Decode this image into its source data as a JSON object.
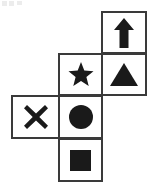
{
  "figure": {
    "name": "cube-net-symbols",
    "type": "cube-net",
    "grid": {
      "columns": 3,
      "rows": 4,
      "cell_width": 46,
      "cell_height": 43,
      "origin_x": 11,
      "origin_y": 11
    },
    "stroke_color": "#3a3a3a",
    "fill_color": "#1a1a1a",
    "background_color": "#ffffff",
    "cells": [
      {
        "id": "cell-arrow",
        "symbol": "arrow-up",
        "label": "Arrow Up",
        "row": 1,
        "col": 3,
        "left": 101,
        "top": 11,
        "width": 46,
        "height": 43
      },
      {
        "id": "cell-star",
        "symbol": "star",
        "label": "Star",
        "row": 2,
        "col": 2,
        "left": 58,
        "top": 53,
        "width": 45,
        "height": 43
      },
      {
        "id": "cell-triangle",
        "symbol": "triangle",
        "label": "Triangle",
        "row": 2,
        "col": 3,
        "left": 101,
        "top": 53,
        "width": 46,
        "height": 43
      },
      {
        "id": "cell-cross",
        "symbol": "x-mark",
        "label": "X Mark",
        "row": 3,
        "col": 1,
        "left": 11,
        "top": 95,
        "width": 49,
        "height": 44
      },
      {
        "id": "cell-circle",
        "symbol": "circle",
        "label": "Circle",
        "row": 3,
        "col": 2,
        "left": 58,
        "top": 95,
        "width": 45,
        "height": 44
      },
      {
        "id": "cell-square",
        "symbol": "square",
        "label": "Square",
        "row": 4,
        "col": 2,
        "left": 58,
        "top": 138,
        "width": 45,
        "height": 44
      }
    ],
    "artifacts": {
      "top_left_marks": 3,
      "color": "#c9c9c9"
    }
  }
}
